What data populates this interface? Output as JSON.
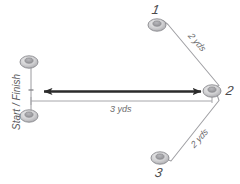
{
  "diagram": {
    "type": "agility-drill-diagram",
    "background_color": "#ffffff",
    "line_color": "#8a8a8c",
    "arrow_color": "#2b2b2b",
    "text_color": "#58585a",
    "cones": [
      {
        "id": "cone-start-top",
        "label": "",
        "x": 29,
        "y": 61
      },
      {
        "id": "cone-start-bottom",
        "label": "",
        "x": 29,
        "y": 116
      },
      {
        "id": "cone-1",
        "label": "1",
        "x": 157,
        "y": 24
      },
      {
        "id": "cone-2",
        "label": "2",
        "x": 213,
        "y": 91
      },
      {
        "id": "cone-3",
        "label": "3",
        "x": 160,
        "y": 158
      }
    ],
    "labels": {
      "cone_one": "1",
      "cone_two": "2",
      "cone_three": "3",
      "start_finish": "Start / Finish",
      "distance_top": "2 yds",
      "distance_bottom": "2 yds",
      "distance_main": "3 yds"
    }
  }
}
